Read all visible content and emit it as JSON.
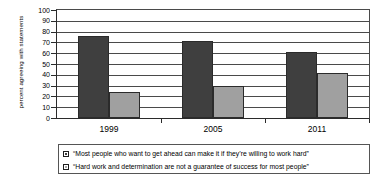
{
  "chart_data": {
    "type": "bar",
    "title": "",
    "subtitle": "",
    "xlabel": "",
    "ylabel": "percent agreeing with statements",
    "categories": [
      "1999",
      "2005",
      "2011"
    ],
    "ylim": [
      0,
      100
    ],
    "ytick_step": 10,
    "yticks": [
      "100",
      "90",
      "80",
      "70",
      "60",
      "50",
      "40",
      "30",
      "20",
      "10",
      "0"
    ],
    "grid": true,
    "grid_axis": "y",
    "legend_position": "bottom",
    "series": [
      {
        "name": "“Most people who want to get ahead can make it if they’re willing to work hard”",
        "color": "#3f3f3f",
        "values": [
          75,
          70,
          60
        ]
      },
      {
        "name": "“Hard work and determination are not a guarantee of success for most people”",
        "color": "#a0a0a0",
        "values": [
          23,
          29,
          41
        ]
      }
    ]
  },
  "colors": {
    "series_dark": "#3f3f3f",
    "series_light": "#a0a0a0",
    "axis": "#2b2b2b",
    "gridline": "#4a4a4a",
    "legend_border": "#555555",
    "background": "#ffffff"
  }
}
